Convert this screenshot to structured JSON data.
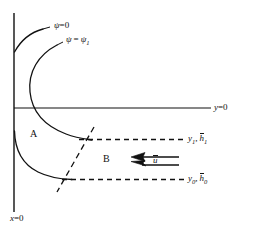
{
  "figure": {
    "name": "streamline-flow-diagram",
    "background_color": "#ffffff",
    "line_color": "#111111",
    "width": 254,
    "height": 230
  },
  "axes": {
    "vertical_axis_label": "x = 0",
    "vertical_axis_var": "x",
    "vertical_axis_value": "0",
    "horizontal_axis_label": "y = 0",
    "horizontal_axis_var": "y",
    "horizontal_axis_value": "0"
  },
  "labels": {
    "psi_zero": {
      "var": "ψ",
      "eq": "=",
      "value": "0",
      "full": "ψ = 0"
    },
    "psi_one": {
      "var": "ψ",
      "eq": "=",
      "value": "ψ",
      "sub": "1",
      "full": "ψ = ψ₁"
    },
    "upper_level": {
      "y_var": "y",
      "y_sub": "1",
      "sep": ",",
      "h_var": "h",
      "h_sub": "1",
      "full": "y₁, h̅1"
    },
    "lower_level": {
      "y_var": "y",
      "y_sub": "0",
      "sep": ",",
      "h_var": "h",
      "h_sub": "0",
      "full": "y₀, h̅0"
    },
    "velocity": {
      "var": "u",
      "full": "u̅"
    }
  },
  "regions": [
    {
      "id": "A",
      "label": "A"
    },
    {
      "id": "B",
      "label": "B"
    }
  ],
  "arrows": {
    "direction": "left",
    "count": 2,
    "label": "u̅"
  },
  "curves": [
    {
      "name": "psi-zero-streamline",
      "style": "solid"
    },
    {
      "name": "psi-one-streamline",
      "style": "solid"
    },
    {
      "name": "lower-streamline",
      "style": "solid"
    },
    {
      "name": "shock-line",
      "style": "dashed"
    },
    {
      "name": "upper-level-line",
      "style": "dashed"
    },
    {
      "name": "lower-level-line",
      "style": "dashed"
    }
  ]
}
